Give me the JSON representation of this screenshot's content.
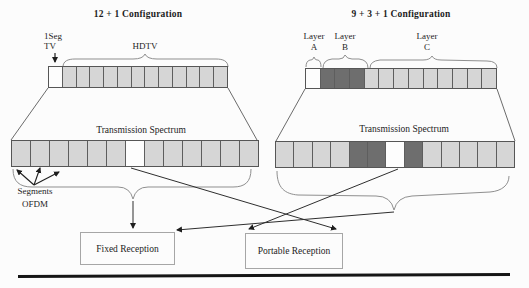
{
  "colors": {
    "light": "#d6d6d6",
    "dark": "#6e6e6e",
    "white": "#fdfdfd",
    "border": "#565656",
    "line": "#3c3c3c",
    "brace": "#8f8f8f"
  },
  "left": {
    "title": "12 + 1 Configuration",
    "oneseg_line1": "1Seg",
    "oneseg_line2": "TV",
    "hdtv": "HDTV",
    "transmission": "Transmission Spectrum",
    "segments_line1": "Segments",
    "segments_line2": "OFDM",
    "bar": [
      "white",
      "light",
      "light",
      "light",
      "light",
      "light",
      "light",
      "light",
      "light",
      "light",
      "light",
      "light",
      "light"
    ],
    "spectrum": [
      "light",
      "light",
      "light",
      "light",
      "light",
      "light",
      "white",
      "light",
      "light",
      "light",
      "light",
      "light",
      "light"
    ]
  },
  "right": {
    "title": "9 + 3 + 1 Configuration",
    "layer_a": "Layer",
    "layer_a_letter": "A",
    "layer_b": "Layer",
    "layer_b_letter": "B",
    "layer_c": "Layer",
    "layer_c_letter": "C",
    "transmission": "Transmission Spectrum",
    "bar": [
      "white",
      "dark",
      "dark",
      "dark",
      "light",
      "light",
      "light",
      "light",
      "light",
      "light",
      "light",
      "light",
      "light"
    ],
    "spectrum": [
      "light",
      "light",
      "light",
      "light",
      "dark",
      "dark",
      "white",
      "dark",
      "light",
      "light",
      "light",
      "light",
      "light"
    ]
  },
  "boxes": {
    "fixed": "Fixed Reception",
    "portable": "Portable Reception"
  }
}
